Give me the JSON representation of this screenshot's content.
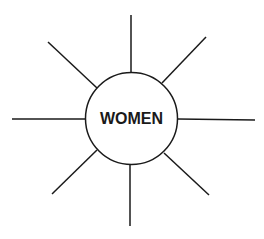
{
  "diagram": {
    "center_label": "WOMEN",
    "spokes": 8,
    "stroke_color": "#1a1a1a",
    "background": "#ffffff"
  }
}
